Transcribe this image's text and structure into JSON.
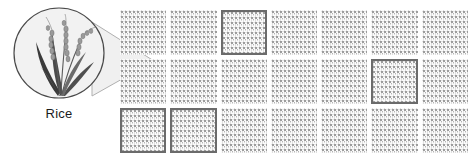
{
  "figure": {
    "background_color": "#ffffff",
    "width": 473,
    "height": 160
  },
  "magnifier": {
    "name": "magnifier-circle",
    "specimen_label": "Rice",
    "circle_fill": "#f2f2f2",
    "circle_stroke": "#4a4a4a",
    "cone_fill": "#f0f0f0",
    "cone_stroke": "#9a9a9a",
    "illustration": {
      "name": "rice-plant-illustration",
      "leaf_color_dark": "#3b3b3b",
      "leaf_color_mid": "#6e6e6e",
      "grain_color": "#8c8c8c",
      "stem_color": "#5a5a5a"
    }
  },
  "field": {
    "name": "field-plot-grid",
    "columns": 7,
    "rows": 3,
    "plot_fill": "#fbfbfb",
    "plot_texture_color": "#9a9a9a",
    "selected_border_color": "#6b6b6b",
    "selected_plots": [
      {
        "row": 1,
        "col": 3
      },
      {
        "row": 2,
        "col": 6
      },
      {
        "row": 3,
        "col": 1
      },
      {
        "row": 3,
        "col": 2
      }
    ],
    "plots": [
      {
        "row": 1,
        "col": 1,
        "selected": false
      },
      {
        "row": 1,
        "col": 2,
        "selected": false
      },
      {
        "row": 1,
        "col": 3,
        "selected": true
      },
      {
        "row": 1,
        "col": 4,
        "selected": false
      },
      {
        "row": 1,
        "col": 5,
        "selected": false
      },
      {
        "row": 1,
        "col": 6,
        "selected": false
      },
      {
        "row": 1,
        "col": 7,
        "selected": false
      },
      {
        "row": 2,
        "col": 1,
        "selected": false
      },
      {
        "row": 2,
        "col": 2,
        "selected": false
      },
      {
        "row": 2,
        "col": 3,
        "selected": false
      },
      {
        "row": 2,
        "col": 4,
        "selected": false
      },
      {
        "row": 2,
        "col": 5,
        "selected": false
      },
      {
        "row": 2,
        "col": 6,
        "selected": true
      },
      {
        "row": 2,
        "col": 7,
        "selected": false
      },
      {
        "row": 3,
        "col": 1,
        "selected": true
      },
      {
        "row": 3,
        "col": 2,
        "selected": true
      },
      {
        "row": 3,
        "col": 3,
        "selected": false
      },
      {
        "row": 3,
        "col": 4,
        "selected": false
      },
      {
        "row": 3,
        "col": 5,
        "selected": false
      },
      {
        "row": 3,
        "col": 6,
        "selected": false
      },
      {
        "row": 3,
        "col": 7,
        "selected": false
      }
    ]
  }
}
